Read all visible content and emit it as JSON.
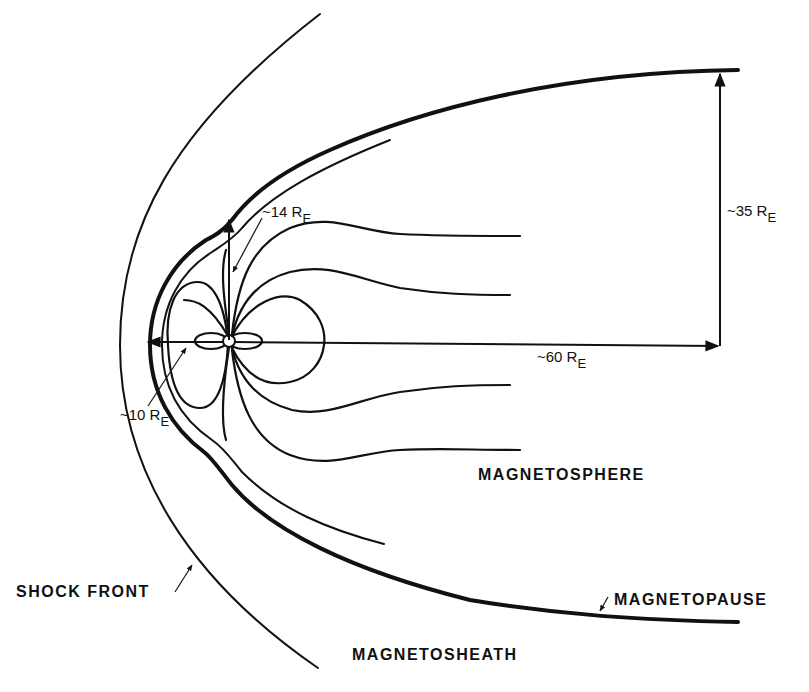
{
  "diagram": {
    "colors": {
      "ink": "#111111",
      "background": "#ffffff"
    },
    "regions": {
      "magnetosphere": "MAGNETOSPHERE",
      "magnetosheath": "MAGNETOSHEATH"
    },
    "boundaries": {
      "shock_front": "SHOCK FRONT",
      "magnetopause": "MAGNETOPAUSE"
    },
    "dimensions": {
      "subsolar_distance": {
        "prefix": "~10 R",
        "subscript": "E"
      },
      "polar_cusp_distance": {
        "prefix": "~14 R",
        "subscript": "E"
      },
      "tail_length": {
        "prefix": "~60 R",
        "subscript": "E"
      },
      "tail_radius": {
        "prefix": "~35 R",
        "subscript": "E"
      }
    }
  }
}
